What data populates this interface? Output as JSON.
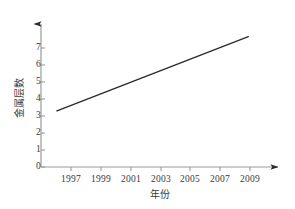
{
  "chart_data": {
    "type": "line",
    "title": "",
    "subtitle": "",
    "xlabel": "年份",
    "ylabel": "金属层数",
    "x": [
      1997,
      2009
    ],
    "values": [
      3.1,
      7.2
    ],
    "series": [
      {
        "name": "",
        "x": [
          1997,
          2009
        ],
        "values": [
          3.1,
          7.2
        ]
      }
    ],
    "xticks": [
      1997,
      1999,
      2001,
      2003,
      2005,
      2007,
      2009
    ],
    "xtick_labels": [
      "1997",
      "1999",
      "2001",
      "2003",
      "2005",
      "2007",
      "2009"
    ],
    "yticks": [
      0,
      1,
      2,
      3,
      4,
      5,
      6,
      7
    ],
    "ytick_labels": [
      "0",
      "1",
      "2",
      "3",
      "4",
      "5",
      "6",
      "7"
    ],
    "xlim": [
      1996.0,
      2010.8
    ],
    "ylim": [
      0,
      7.9
    ],
    "grid": false,
    "legend": false,
    "legend_position": "none",
    "annotations": [],
    "line_color": "#2b2b2b",
    "axis_color": "#9a9a9a",
    "background_color": "#ffffff",
    "x_axis_arrow": true,
    "y_axis_arrow": true
  },
  "geometry": {
    "origin_x": 41,
    "origin_y": 167,
    "x_axis_end": 285,
    "y_axis_top": 17,
    "px_per_year": 14.92,
    "px_per_unit": 17.0
  }
}
